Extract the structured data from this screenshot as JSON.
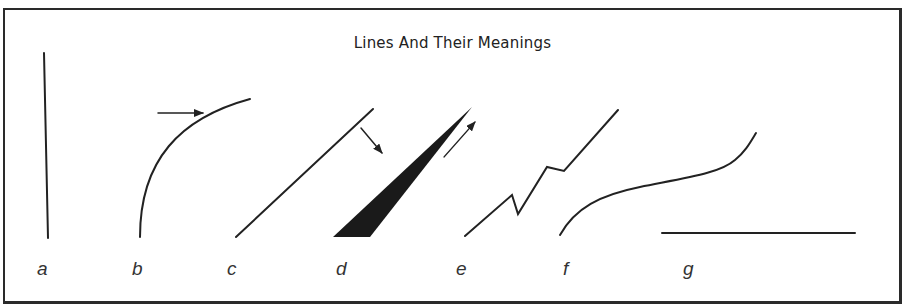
{
  "title": "Lines And Their Meanings",
  "labels": {
    "a": "a",
    "b": "b",
    "c": "c",
    "d": "d",
    "e": "e",
    "f": "f",
    "g": "g"
  },
  "figures": [
    {
      "id": "a",
      "shape": "vertical-line"
    },
    {
      "id": "b",
      "shape": "curve-rising-then-flattening",
      "annotation": "arrow-right"
    },
    {
      "id": "c",
      "shape": "diagonal-line"
    },
    {
      "id": "d",
      "shape": "filled-wedge",
      "annotation": "arrow-down-right"
    },
    {
      "id": "e",
      "shape": "zigzag-rising",
      "annotation": "arrow-up-right"
    },
    {
      "id": "f",
      "shape": "s-curve-rising"
    },
    {
      "id": "g",
      "shape": "horizontal-line"
    }
  ],
  "colors": {
    "ink": "#222222",
    "background": "#ffffff"
  }
}
